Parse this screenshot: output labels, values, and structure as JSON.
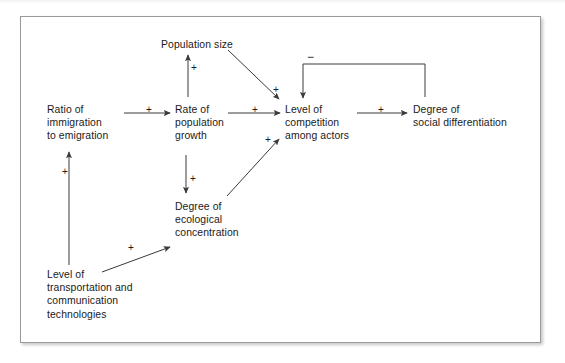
{
  "figure": {
    "type": "causal-loop-diagram",
    "nodes": [
      {
        "id": "population_size",
        "label": "Population size",
        "lines": [
          "Population size"
        ],
        "x": 161,
        "y": 38
      },
      {
        "id": "ratio_immigration_emigration",
        "label": "Ratio of immigration to emigration",
        "lines": [
          "Ratio of",
          "immigration",
          "to emigration"
        ],
        "x": 47,
        "y": 103
      },
      {
        "id": "rate_population_growth",
        "label": "Rate of population growth",
        "lines": [
          "Rate of",
          "population",
          "growth"
        ],
        "x": 175,
        "y": 103
      },
      {
        "id": "level_competition_among_actors",
        "label": "Level of competition among actors",
        "lines": [
          "Level of",
          "competition",
          "among actors"
        ],
        "x": 285,
        "y": 103
      },
      {
        "id": "degree_social_differentiation",
        "label": "Degree of social differentiation",
        "lines": [
          "Degree of",
          "social differentiation"
        ],
        "x": 413,
        "y": 103
      },
      {
        "id": "degree_ecological_concentration",
        "label": "Degree of ecological concentration",
        "lines": [
          "Degree of",
          "ecological",
          "concentration"
        ],
        "x": 175,
        "y": 200
      },
      {
        "id": "level_transportation_communication",
        "label": "Level of transportation and communication technologies",
        "lines": [
          "Level of",
          "transportation and",
          "communication",
          "technologies"
        ],
        "x": 47,
        "y": 268
      }
    ],
    "edges": [
      {
        "from": "ratio_immigration_emigration",
        "to": "rate_population_growth",
        "sign": "+",
        "sign_x": 146,
        "sign_y": 105
      },
      {
        "from": "rate_population_growth",
        "to": "population_size",
        "sign": "+",
        "sign_x": 191,
        "sign_y": 63
      },
      {
        "from": "rate_population_growth",
        "to": "level_competition_among_actors",
        "sign": "+",
        "sign_x": 252,
        "sign_y": 105
      },
      {
        "from": "population_size",
        "to": "level_competition_among_actors",
        "sign": "+",
        "sign_x": 273,
        "sign_y": 85
      },
      {
        "from": "level_competition_among_actors",
        "to": "degree_social_differentiation",
        "sign": "+",
        "sign_x": 378,
        "sign_y": 105
      },
      {
        "from": "degree_social_differentiation",
        "to": "level_competition_among_actors",
        "sign": "−",
        "sign_x": 307,
        "sign_y": 56
      },
      {
        "from": "rate_population_growth",
        "to": "degree_ecological_concentration",
        "sign": "+",
        "sign_x": 190,
        "sign_y": 174
      },
      {
        "from": "degree_ecological_concentration",
        "to": "level_competition_among_actors",
        "sign": "+",
        "sign_x": 265,
        "sign_y": 135
      },
      {
        "from": "level_transportation_communication",
        "to": "ratio_immigration_emigration",
        "sign": "+",
        "sign_x": 62,
        "sign_y": 167
      },
      {
        "from": "level_transportation_communication",
        "to": "degree_ecological_concentration",
        "sign": "+",
        "sign_x": 128,
        "sign_y": 243
      }
    ],
    "colors": {
      "stroke": "#3a3a3a",
      "text": "#1a1a1a",
      "border": "#9a9a9a",
      "background": "#ffffff"
    }
  }
}
